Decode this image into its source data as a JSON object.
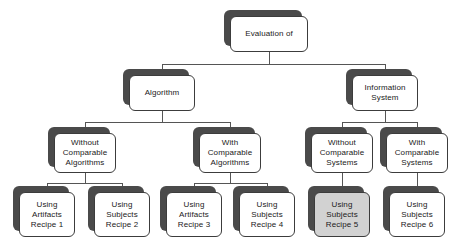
{
  "diagram": {
    "type": "hierarchy-tree",
    "colors": {
      "node_fill": "#ffffff",
      "node_border": "#3c3c3c",
      "shadow": "#4a4a4a",
      "highlight_fill": "#d2d2d2",
      "edge": "#555555",
      "background": "#ffffff"
    },
    "nodes": [
      {
        "id": "root",
        "level": 0,
        "lines": [
          "Evaluation of"
        ],
        "highlighted": false,
        "x": 230,
        "y": 16,
        "w": 78,
        "h": 36
      },
      {
        "id": "algorithm",
        "level": 1,
        "lines": [
          "Algorithm"
        ],
        "highlighted": false,
        "x": 129,
        "y": 75,
        "w": 66,
        "h": 36
      },
      {
        "id": "information-system",
        "level": 1,
        "lines": [
          "Information",
          "System"
        ],
        "highlighted": false,
        "x": 352,
        "y": 75,
        "w": 66,
        "h": 36
      },
      {
        "id": "without-comparable-algorithms",
        "level": 2,
        "lines": [
          "Without",
          "Comparable",
          "Algorithms"
        ],
        "highlighted": false,
        "x": 54,
        "y": 133,
        "w": 62,
        "h": 40
      },
      {
        "id": "with-comparable-algorithms",
        "level": 2,
        "lines": [
          "With",
          "Comparable",
          "Algorithms"
        ],
        "highlighted": false,
        "x": 199,
        "y": 133,
        "w": 62,
        "h": 40
      },
      {
        "id": "without-comparable-systems",
        "level": 2,
        "lines": [
          "Without",
          "Comparable",
          "Systems"
        ],
        "highlighted": false,
        "x": 311,
        "y": 133,
        "w": 62,
        "h": 40
      },
      {
        "id": "with-comparable-systems",
        "level": 2,
        "lines": [
          "With",
          "Comparable",
          "Systems"
        ],
        "highlighted": false,
        "x": 386,
        "y": 133,
        "w": 62,
        "h": 40
      },
      {
        "id": "recipe-1",
        "level": 3,
        "lines": [
          "Using",
          "Artifacts",
          "Recipe 1"
        ],
        "highlighted": false,
        "x": 19,
        "y": 192,
        "w": 56,
        "h": 45
      },
      {
        "id": "recipe-2",
        "level": 3,
        "lines": [
          "Using",
          "Subjects",
          "Recipe 2"
        ],
        "highlighted": false,
        "x": 94,
        "y": 192,
        "w": 56,
        "h": 45
      },
      {
        "id": "recipe-3",
        "level": 3,
        "lines": [
          "Using",
          "Artifacts",
          "Recipe 3"
        ],
        "highlighted": false,
        "x": 166,
        "y": 192,
        "w": 56,
        "h": 45
      },
      {
        "id": "recipe-4",
        "level": 3,
        "lines": [
          "Using",
          "Subjects",
          "Recipe 4"
        ],
        "highlighted": false,
        "x": 239,
        "y": 192,
        "w": 56,
        "h": 45
      },
      {
        "id": "recipe-5",
        "level": 3,
        "lines": [
          "Using",
          "Subjects",
          "Recipe 5"
        ],
        "highlighted": true,
        "x": 314,
        "y": 192,
        "w": 56,
        "h": 45
      },
      {
        "id": "recipe-6",
        "level": 3,
        "lines": [
          "Using",
          "Subjects",
          "Recipe 6"
        ],
        "highlighted": false,
        "x": 389,
        "y": 192,
        "w": 56,
        "h": 45
      }
    ],
    "edges": [
      {
        "from": "root",
        "to": "algorithm"
      },
      {
        "from": "root",
        "to": "information-system"
      },
      {
        "from": "algorithm",
        "to": "without-comparable-algorithms"
      },
      {
        "from": "algorithm",
        "to": "with-comparable-algorithms"
      },
      {
        "from": "information-system",
        "to": "without-comparable-systems"
      },
      {
        "from": "information-system",
        "to": "with-comparable-systems"
      },
      {
        "from": "without-comparable-algorithms",
        "to": "recipe-1"
      },
      {
        "from": "without-comparable-algorithms",
        "to": "recipe-2"
      },
      {
        "from": "with-comparable-algorithms",
        "to": "recipe-3"
      },
      {
        "from": "with-comparable-algorithms",
        "to": "recipe-4"
      },
      {
        "from": "without-comparable-systems",
        "to": "recipe-5"
      },
      {
        "from": "with-comparable-systems",
        "to": "recipe-6"
      }
    ]
  }
}
